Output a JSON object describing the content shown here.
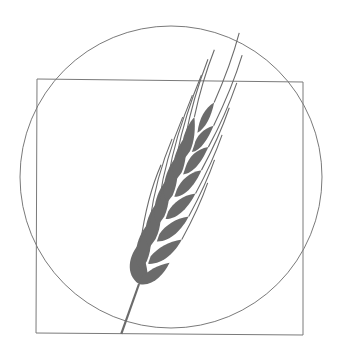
{
  "figure": {
    "colors": {
      "background": "#ffffff",
      "outline": "#7a7a7a",
      "grain": "#6b6b6b"
    },
    "circle": {
      "cx": 171,
      "cy": 177,
      "r": 151
    },
    "square": {
      "x": 37,
      "y": 80,
      "width": 266,
      "height": 254
    },
    "wheat": {
      "base": [
        124,
        334
      ],
      "spike_bottom": [
        139,
        284
      ],
      "spike_top": [
        203,
        100
      ],
      "grain_pairs": 7,
      "tilt_degrees": 19
    }
  }
}
